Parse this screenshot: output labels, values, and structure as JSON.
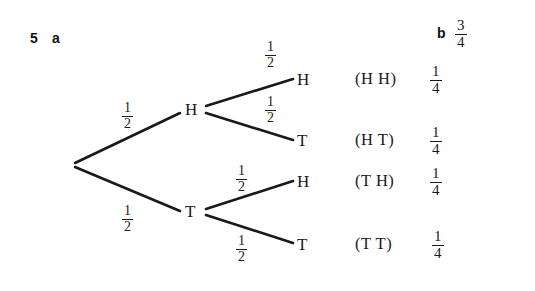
{
  "figure": {
    "question_number": "5",
    "parts": {
      "a_label": "a",
      "b_label": "b",
      "b_answer": {
        "numerator": "3",
        "denominator": "4"
      }
    },
    "background_color": "#ffffff",
    "line_color": "#1a1a1a"
  },
  "diagram": {
    "type": "probability-tree",
    "root": {
      "label": "",
      "x": 74,
      "y": 163
    },
    "level1": [
      {
        "id": "h",
        "node_label": "H",
        "x": 192,
        "y": 110,
        "branch_probability": {
          "numerator": "1",
          "denominator": "2"
        },
        "prob_label_x": 130,
        "prob_label_y": 116
      },
      {
        "id": "t",
        "node_label": "T",
        "x": 192,
        "y": 212,
        "branch_probability": {
          "numerator": "1",
          "denominator": "2"
        },
        "prob_label_x": 130,
        "prob_label_y": 218
      }
    ],
    "level2": [
      {
        "id": "hh",
        "node_label": "H",
        "x": 303,
        "y": 80,
        "branch_probability": {
          "numerator": "1",
          "denominator": "2"
        },
        "prob_label_x": 272,
        "prob_label_y": 55
      },
      {
        "id": "ht",
        "node_label": "T",
        "x": 303,
        "y": 141,
        "branch_probability": {
          "numerator": "1",
          "denominator": "2"
        },
        "prob_label_x": 272,
        "prob_label_y": 109
      },
      {
        "id": "th",
        "node_label": "H",
        "x": 303,
        "y": 182,
        "branch_probability": {
          "numerator": "1",
          "denominator": "2"
        },
        "prob_label_x": 243,
        "prob_label_y": 178
      },
      {
        "id": "tt",
        "node_label": "T",
        "x": 303,
        "y": 245,
        "branch_probability": {
          "numerator": "1",
          "denominator": "2"
        },
        "prob_label_x": 243,
        "prob_label_y": 248
      }
    ],
    "outcomes": [
      {
        "id": "hh",
        "text": "(H  H)",
        "probability": {
          "numerator": "1",
          "denominator": "4"
        },
        "text_x": 355,
        "text_y": 80,
        "frac_x": 432,
        "frac_y": 80
      },
      {
        "id": "ht",
        "text": "(H  T)",
        "probability": {
          "numerator": "1",
          "denominator": "4"
        },
        "text_x": 355,
        "text_y": 141,
        "frac_x": 432,
        "frac_y": 141
      },
      {
        "id": "th",
        "text": "(T  H)",
        "probability": {
          "numerator": "1",
          "denominator": "4"
        },
        "text_x": 355,
        "text_y": 182,
        "frac_x": 432,
        "frac_y": 182
      },
      {
        "id": "tt",
        "text": "(T  T)",
        "probability": {
          "numerator": "1",
          "denominator": "4"
        },
        "text_x": 355,
        "text_y": 245,
        "frac_x": 432,
        "frac_y": 245
      }
    ]
  }
}
